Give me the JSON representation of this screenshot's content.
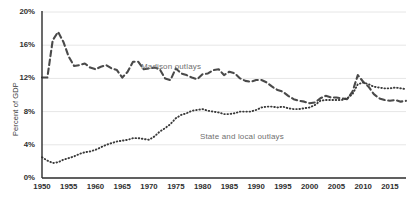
{
  "chart_data": {
    "type": "line",
    "title": "",
    "subtitle": "",
    "xlabel": "",
    "ylabel": "Percent of GDP",
    "xlim": [
      1950,
      2018
    ],
    "ylim": [
      0,
      20
    ],
    "grid": true,
    "grid_axis": "y",
    "legend": "inline-labels",
    "y_ticks": [
      "0%",
      "4%",
      "8%",
      "12%",
      "16%",
      "20%"
    ],
    "y_tick_values": [
      0,
      4,
      8,
      12,
      16,
      20
    ],
    "x_ticks": [
      "1950",
      "1955",
      "1960",
      "1965",
      "1970",
      "1975",
      "1980",
      "1985",
      "1990",
      "1995",
      "2000",
      "2005",
      "2010",
      "2015"
    ],
    "x_tick_values": [
      1950,
      1955,
      1960,
      1965,
      1970,
      1975,
      1980,
      1985,
      1990,
      1995,
      2000,
      2005,
      2010,
      2015
    ],
    "x": [
      1950,
      1951,
      1952,
      1953,
      1954,
      1955,
      1956,
      1957,
      1958,
      1959,
      1960,
      1961,
      1962,
      1963,
      1964,
      1965,
      1966,
      1967,
      1968,
      1969,
      1970,
      1971,
      1972,
      1973,
      1974,
      1975,
      1976,
      1977,
      1978,
      1979,
      1980,
      1981,
      1982,
      1983,
      1984,
      1985,
      1986,
      1987,
      1988,
      1989,
      1990,
      1991,
      1992,
      1993,
      1994,
      1995,
      1996,
      1997,
      1998,
      1999,
      2000,
      2001,
      2002,
      2003,
      2004,
      2005,
      2006,
      2007,
      2008,
      2009,
      2010,
      2011,
      2012,
      2013,
      2014,
      2015,
      2016,
      2017,
      2018
    ],
    "series": [
      {
        "name": "Madison outlays",
        "style": "dashed",
        "color": "#4a4a4a",
        "label_position": {
          "x": 1968.5,
          "y": 13.4
        },
        "values": [
          12.1,
          12.1,
          16.6,
          17.6,
          16.4,
          14.6,
          13.5,
          13.6,
          13.8,
          13.3,
          13.1,
          13.4,
          13.6,
          13.2,
          13.0,
          12.1,
          12.8,
          14.0,
          14.0,
          13.1,
          13.2,
          13.3,
          13.1,
          12.0,
          11.8,
          13.2,
          12.6,
          12.4,
          12.1,
          11.9,
          12.5,
          12.6,
          13.0,
          13.1,
          12.4,
          12.8,
          12.6,
          12.0,
          11.7,
          11.6,
          11.8,
          11.8,
          11.5,
          11.0,
          10.6,
          10.4,
          9.9,
          9.5,
          9.3,
          9.2,
          9.0,
          9.1,
          9.6,
          9.9,
          9.7,
          9.7,
          9.6,
          9.5,
          10.4,
          12.4,
          11.6,
          11.0,
          10.1,
          9.6,
          9.4,
          9.3,
          9.4,
          9.2,
          9.3
        ],
        "units": "percent of GDP"
      },
      {
        "name": "State and local outlays",
        "style": "dotted",
        "color": "#3a3a3a",
        "label_position": {
          "x": 1979.5,
          "y": 5.0
        },
        "values": [
          2.5,
          2.1,
          1.8,
          1.9,
          2.2,
          2.4,
          2.6,
          2.9,
          3.1,
          3.2,
          3.4,
          3.7,
          4.0,
          4.2,
          4.4,
          4.5,
          4.6,
          4.8,
          4.8,
          4.7,
          4.6,
          5.0,
          5.6,
          6.0,
          6.5,
          7.2,
          7.6,
          7.8,
          8.1,
          8.2,
          8.3,
          8.1,
          8.0,
          7.9,
          7.7,
          7.7,
          7.8,
          8.0,
          8.0,
          8.0,
          8.2,
          8.5,
          8.6,
          8.6,
          8.5,
          8.6,
          8.4,
          8.3,
          8.3,
          8.4,
          8.5,
          8.8,
          9.3,
          9.4,
          9.4,
          9.4,
          9.4,
          9.6,
          10.1,
          11.3,
          11.5,
          11.3,
          11.0,
          10.9,
          10.8,
          10.8,
          10.9,
          10.8,
          10.7
        ],
        "units": "percent of GDP"
      }
    ],
    "colors": {
      "axis": "#2b2b2b",
      "grid": "#e6e6e6",
      "tick_text": "#2e2e2e",
      "series_label_text": "#6f6f6f",
      "background": "#ffffff"
    }
  }
}
